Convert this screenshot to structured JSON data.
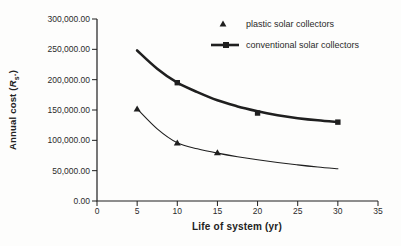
{
  "colors": {
    "ink": "#1f1f1f",
    "text": "#2b2b2b",
    "background": "#fdfdfc"
  },
  "chart_data": {
    "type": "line",
    "title": "",
    "xlabel": "Life of system (yr)",
    "ylabel": "Annual cost (Rs.)",
    "ylabel_parts": {
      "prefix": "Annual cost (",
      "symbol": "R",
      "subscript": "s",
      "suffix": ".)"
    },
    "xlim": [
      0,
      35
    ],
    "ylim": [
      0,
      300000
    ],
    "x_ticks": [
      0,
      5,
      10,
      15,
      20,
      25,
      30,
      35
    ],
    "x_tick_labels": [
      "0",
      "5",
      "10",
      "15",
      "20",
      "25",
      "30",
      "35"
    ],
    "y_ticks": [
      0,
      50000,
      100000,
      150000,
      200000,
      250000,
      300000
    ],
    "y_tick_labels": [
      "0.00",
      "50,000.00",
      "100,000.00",
      "150,000.00",
      "200,000.00",
      "250,000.00",
      "300,000.00"
    ],
    "grid": false,
    "legend_position": "top-right",
    "series": [
      {
        "name": "plastic solar collectors",
        "marker": "triangle",
        "line_width": 1.1,
        "marker_points": [
          [
            5,
            152000
          ],
          [
            10,
            96000
          ],
          [
            15,
            80000
          ]
        ],
        "line_points": [
          [
            5,
            152000
          ],
          [
            7.5,
            119000
          ],
          [
            10,
            96000
          ],
          [
            12.5,
            86000
          ],
          [
            15,
            79000
          ],
          [
            17.5,
            73000
          ],
          [
            20,
            68000
          ],
          [
            22.5,
            63500
          ],
          [
            25,
            59500
          ],
          [
            27.5,
            56000
          ],
          [
            30,
            53000
          ]
        ]
      },
      {
        "name": "conventional solar collectors",
        "marker": "square",
        "line_width": 2.6,
        "marker_points": [
          [
            10,
            195000
          ],
          [
            20,
            145000
          ],
          [
            30,
            130000
          ]
        ],
        "line_points": [
          [
            5,
            248000
          ],
          [
            7.5,
            218000
          ],
          [
            10,
            195000
          ],
          [
            12.5,
            179500
          ],
          [
            15,
            166000
          ],
          [
            17.5,
            156000
          ],
          [
            20,
            148000
          ],
          [
            22.5,
            141500
          ],
          [
            25,
            136500
          ],
          [
            27.5,
            133000
          ],
          [
            30,
            130000
          ]
        ]
      }
    ]
  }
}
